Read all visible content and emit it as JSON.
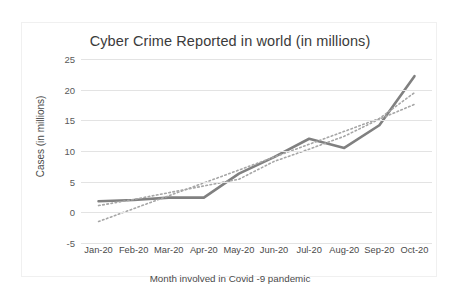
{
  "chart_data": {
    "type": "line",
    "title": "Cyber Crime Reported in world (in millions)",
    "xlabel": "Month involved in Covid -9 pandemic",
    "ylabel": "Cases (in millions)",
    "categories": [
      "Jan-20",
      "Feb-20",
      "Mar-20",
      "Apr-20",
      "May-20",
      "Jun-20",
      "Jul-20",
      "Aug-20",
      "Sep-20",
      "Oct-20"
    ],
    "ylim": [
      -5,
      25
    ],
    "yticks": [
      25,
      20,
      15,
      10,
      5,
      0,
      -5
    ],
    "grid": true,
    "legend": "none",
    "series": [
      {
        "name": "Cases reported",
        "style": "solid",
        "color": "#808080",
        "values": [
          1.8,
          2.0,
          2.4,
          2.4,
          6.3,
          9.0,
          12.0,
          10.5,
          14.2,
          22.2
        ]
      },
      {
        "name": "Linear trendline",
        "style": "dotted",
        "color": "#a6a6a6",
        "values": [
          -1.5,
          0.6,
          2.7,
          4.8,
          6.9,
          9.0,
          11.1,
          13.2,
          15.3,
          19.5
        ]
      },
      {
        "name": "Secondary trendline",
        "style": "dotted",
        "color": "#a6a6a6",
        "values": [
          1.1,
          2.1,
          3.2,
          4.3,
          5.4,
          8.3,
          10.3,
          12.4,
          15.2,
          17.6
        ]
      }
    ]
  }
}
